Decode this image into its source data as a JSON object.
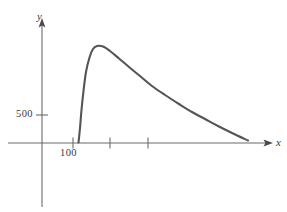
{
  "figure": {
    "background_color": "#ffffff",
    "axis_color": "#6b6b6b",
    "curve_color": "#555555",
    "text_color": "#3a3a3a",
    "width": 287,
    "height": 212
  },
  "labels": {
    "y_axis": "y",
    "x_axis": "x",
    "y_tick_500": "500",
    "x_tick_100": "100"
  },
  "chart_data": {
    "type": "line",
    "title": "",
    "subtitle": "",
    "xlabel": "x",
    "ylabel": "y",
    "grid": false,
    "legend": null,
    "annotations": [],
    "axes": {
      "origin_px": [
        42,
        143
      ],
      "x_axis_tick_labels": [
        "100"
      ],
      "x_axis_tick_values": [
        100,
        150,
        200
      ],
      "y_axis_tick_labels": [
        "500"
      ],
      "y_axis_tick_values": [
        500
      ],
      "xlim": [
        50,
        290
      ],
      "ylim": [
        0,
        1800
      ],
      "x_arrow": true,
      "y_arrow": true
    },
    "series": [
      {
        "name": "curve",
        "color": "#555555",
        "x": [
          107,
          110,
          113,
          117,
          122,
          128,
          134,
          141,
          150,
          160,
          172,
          185,
          198,
          212,
          226,
          240,
          252,
          262,
          270,
          276,
          280
        ],
        "y": [
          0,
          240,
          560,
          900,
          1240,
          1520,
          1660,
          1720,
          1690,
          1590,
          1430,
          1250,
          1075,
          905,
          750,
          615,
          500,
          405,
          330,
          270,
          225
        ],
        "x_px": [
          78.5,
          80,
          81.5,
          83.5,
          86,
          89.5,
          93,
          97,
          103,
          110,
          119,
          129,
          140,
          152,
          165,
          179,
          192,
          205,
          218,
          232,
          248
        ],
        "y_px": [
          142.5,
          128,
          110,
          91,
          72,
          57.5,
          49,
          46,
          46.5,
          51,
          58.5,
          67,
          76,
          86,
          95,
          104,
          112,
          119,
          126,
          133,
          140.5
        ]
      }
    ]
  }
}
